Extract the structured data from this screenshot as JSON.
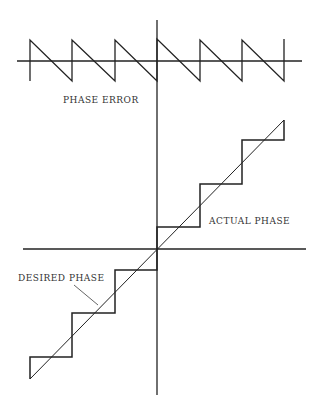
{
  "labels": {
    "phase_error": "PHASE ERROR",
    "actual_phase": "ACTUAL PHASE",
    "desired_phase": "DESIRED PHASE"
  },
  "colors": {
    "ink": "#222222",
    "background": "#ffffff"
  },
  "diagram": {
    "top_plot": {
      "type": "sawtooth",
      "name": "phase error",
      "teeth_x": [
        30,
        72,
        115,
        157,
        200,
        242,
        284
      ],
      "axis_y": 61,
      "high_y": 40,
      "low_y": 81
    },
    "bottom_plot": {
      "type": "staircase-vs-ramp",
      "origin": [
        157,
        249
      ],
      "step_levels_y": [
        357,
        313,
        270,
        227,
        184,
        140
      ],
      "step_edges_x": [
        30,
        72,
        115,
        157,
        200,
        242,
        284
      ],
      "ramp": [
        [
          30,
          379
        ],
        [
          284,
          120
        ]
      ]
    }
  }
}
